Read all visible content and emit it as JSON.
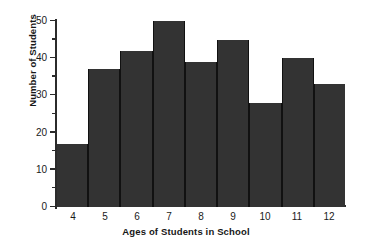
{
  "chart_data": {
    "type": "bar",
    "title": "",
    "xlabel": "Ages of Students in School",
    "ylabel": "Number of Students",
    "categories": [
      "4",
      "5",
      "6",
      "7",
      "8",
      "9",
      "10",
      "11",
      "12"
    ],
    "values": [
      17,
      37,
      42,
      50,
      39,
      45,
      28,
      40,
      33
    ],
    "ylim": [
      0,
      50
    ],
    "ytick_major": [
      0,
      10,
      20,
      30,
      40,
      50
    ],
    "ytick_major_labels": [
      "0",
      "10",
      "20",
      "30",
      "40",
      "50"
    ],
    "ytick_minor": [
      5,
      15,
      25,
      35,
      45
    ],
    "grid": false,
    "legend": false,
    "bar_color": "#333333",
    "axis_color": "#2b2b2b",
    "background": "#ffffff"
  }
}
